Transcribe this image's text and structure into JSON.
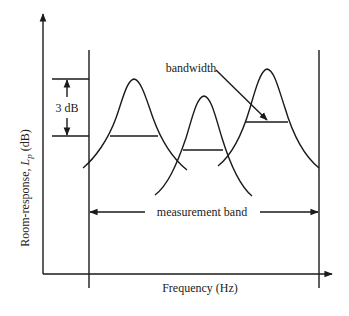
{
  "diagram": {
    "y_axis_label_prefix": "Room-response, ",
    "y_axis_label_symbol": "L",
    "y_axis_label_subscript": "p",
    "y_axis_label_suffix": " (dB)",
    "x_axis_label": "Frequency (Hz)",
    "level_diff_label": "3 dB",
    "bandwidth_label": "bandwidth",
    "measurement_band_label": "measurement band",
    "peaks": [
      {
        "name": "mode-1",
        "apex_x": 134,
        "apex_y": 79,
        "halfpower_y": 136
      },
      {
        "name": "mode-2",
        "apex_x": 204,
        "apex_y": 96,
        "halfpower_y": 150
      },
      {
        "name": "mode-3",
        "apex_x": 267,
        "apex_y": 69,
        "halfpower_y": 122
      }
    ],
    "line_color": "#1a1a1a"
  }
}
